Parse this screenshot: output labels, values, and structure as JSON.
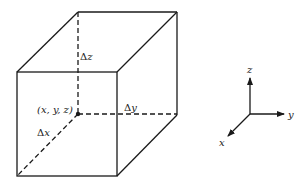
{
  "figure": {
    "type": "control-volume-diagram",
    "stroke_color": "#1a1a1a",
    "labels": {
      "point": "(x, y, z)",
      "dx_delta": "Δ",
      "dx_var": "x",
      "dy_delta": "Δ",
      "dy_var": "y",
      "dz_delta": "Δ",
      "dz_var": "z"
    },
    "axes": {
      "x_label": "x",
      "y_label": "y",
      "z_label": "z"
    }
  }
}
